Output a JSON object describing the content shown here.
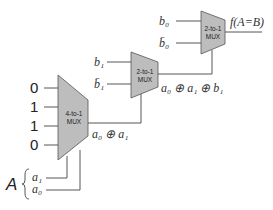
{
  "diagram": {
    "mux4": {
      "label_line1": "4-to-1",
      "label_line2": "MUX",
      "inputs": [
        "0",
        "1",
        "1",
        "0"
      ],
      "output": "a₀ ⊕ a₁"
    },
    "mux2_mid": {
      "label_line1": "2-to-1",
      "label_line2": "MUX",
      "input_top": "b₁",
      "input_bottom": "b̄₁",
      "output": "a₀ ⊕ a₁ ⊕ b₁"
    },
    "mux2_top": {
      "label_line1": "2-to-1",
      "label_line2": "MUX",
      "input_top": "b₀",
      "input_bottom": "b̄₀",
      "output": "f(A=B)"
    },
    "select": {
      "bus_name": "A",
      "lines": [
        "a₁",
        "a₀"
      ]
    },
    "colors": {
      "mux_fill": "#bdbdbd",
      "wire": "#444444"
    }
  }
}
